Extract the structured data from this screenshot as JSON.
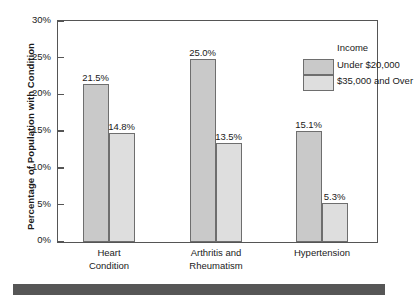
{
  "chart_data": {
    "type": "bar",
    "title": "",
    "xlabel": "",
    "ylabel": "Percentage of Population with Condition",
    "ylim": [
      0,
      30
    ],
    "ytick_labels": [
      "0%",
      "5%",
      "10%",
      "15%",
      "20%",
      "25%",
      "30%"
    ],
    "ytick_values": [
      0,
      5,
      10,
      15,
      20,
      25,
      30
    ],
    "grid": false,
    "legend_title": "Income",
    "legend_position": "top-right inside plot",
    "categories": [
      "Heart Condition",
      "Arthritis and Rheumatism",
      "Hypertension"
    ],
    "category_lines": [
      [
        "Heart",
        "Condition"
      ],
      [
        "Arthritis and",
        "Rheumatism"
      ],
      [
        "Hypertension"
      ]
    ],
    "series": [
      {
        "name": "Under $20,000",
        "color": "#c9c9c9",
        "values": [
          21.5,
          25.0,
          15.1
        ],
        "labels": [
          "21.5%",
          "25.0%",
          "15.1%"
        ]
      },
      {
        "name": "$35,000 and Over",
        "color": "#dedede",
        "values": [
          14.8,
          13.5,
          5.3
        ],
        "labels": [
          "14.8%",
          "13.5%",
          "5.3%"
        ]
      }
    ]
  },
  "legend": {
    "title": "Income",
    "entries": [
      {
        "label": "Under $20,000",
        "color": "#c9c9c9"
      },
      {
        "label": "$35,000 and Over",
        "color": "#dedede"
      }
    ]
  },
  "axes": {
    "y_title": "Percentage of Population with Condition"
  },
  "colors": {
    "series_low_income": "#c9c9c9",
    "series_high_income": "#dedede",
    "bar_outline": "#6e6e6e",
    "axis": "#555555",
    "bottom_rule": "#565656",
    "text": "#1a1a1a"
  }
}
